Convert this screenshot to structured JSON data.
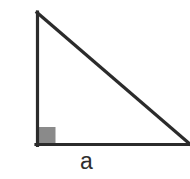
{
  "figure": {
    "name": "right-triangle-diagram",
    "width": 190,
    "height": 179,
    "background_color": "#ffffff",
    "stroke_color": "#2b2b2b",
    "stroke_width": 3,
    "right_angle_marker": {
      "name": "right-angle-square",
      "fill_color": "#8a8a8a",
      "x": 37,
      "y": 127,
      "size": 18
    },
    "vertices": {
      "apex": [
        37,
        12
      ],
      "right_angle": [
        37,
        145
      ],
      "base_right": [
        190,
        145
      ]
    }
  },
  "labels": {
    "vertical_leg": "a",
    "horizontal_leg": "a"
  }
}
